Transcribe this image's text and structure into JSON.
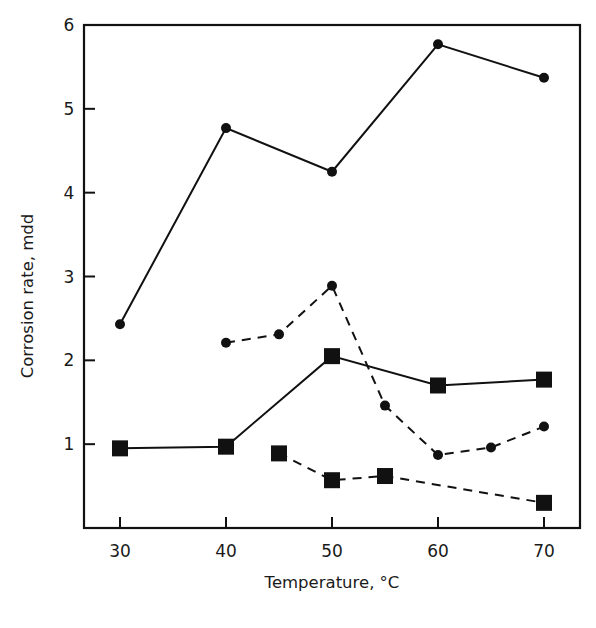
{
  "chart_data": {
    "type": "line",
    "title": "",
    "xlabel": "Temperature, °C",
    "ylabel": "Corrosion rate, mdd",
    "xlim": [
      27,
      73
    ],
    "ylim": [
      0,
      6
    ],
    "xticks": [
      30,
      40,
      50,
      60,
      70
    ],
    "yticks": [
      1,
      2,
      3,
      4,
      5,
      6
    ],
    "grid": false,
    "legend": null,
    "series": [
      {
        "name": "solid-circles",
        "marker": "circle",
        "line": "solid",
        "x": [
          30,
          40,
          50,
          60,
          70
        ],
        "y": [
          2.43,
          4.77,
          4.25,
          5.77,
          5.37
        ]
      },
      {
        "name": "dashed-circles",
        "marker": "circle",
        "line": "dashed",
        "x": [
          40,
          45,
          50,
          55,
          60,
          65,
          70
        ],
        "y": [
          2.21,
          2.31,
          2.89,
          1.46,
          0.87,
          0.96,
          1.21
        ]
      },
      {
        "name": "solid-squares",
        "marker": "square",
        "line": "solid",
        "x": [
          30,
          40,
          50,
          60,
          70
        ],
        "y": [
          0.95,
          0.97,
          2.05,
          1.7,
          1.77
        ]
      },
      {
        "name": "dashed-squares",
        "marker": "square",
        "line": "dashed",
        "x": [
          45,
          50,
          55,
          70
        ],
        "y": [
          0.89,
          0.57,
          0.62,
          0.3
        ]
      }
    ]
  },
  "colors": {
    "ink": "#111111",
    "background": "#ffffff"
  }
}
